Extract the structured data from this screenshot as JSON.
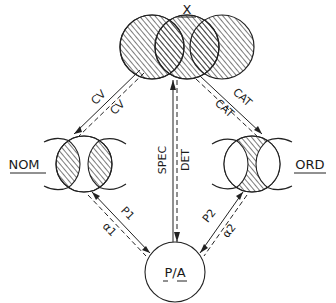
{
  "diagram": {
    "nodes": {
      "x": {
        "label": "X"
      },
      "nom": {
        "label": "NOM"
      },
      "ord": {
        "label": "ORD"
      },
      "pa": {
        "label": "P/A"
      }
    },
    "edges": {
      "x_nom": {
        "labels": [
          "CV",
          "CV"
        ]
      },
      "x_ord": {
        "labels": [
          "CAT",
          "CAT"
        ]
      },
      "x_pa": {
        "labels": [
          "SPEC",
          "DET"
        ]
      },
      "nom_pa": {
        "labels": [
          "P1",
          "α1"
        ]
      },
      "ord_pa": {
        "labels": [
          "P2",
          "α2"
        ]
      }
    }
  }
}
